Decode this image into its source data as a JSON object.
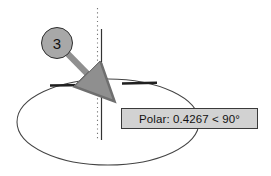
{
  "drawing": {
    "title": "Ellipse polar tracking step",
    "background_color": "#ffffff",
    "line_color": "#3a3a3a"
  },
  "callout": {
    "number": "3",
    "fill_color": "#a8a8a8",
    "border_color": "#2e2e2e",
    "arrow_color": "#8f8f8f"
  },
  "tooltip": {
    "text": "Polar: 0.4267 < 90°",
    "label": "Polar:",
    "distance": "0.4267",
    "comparator": "<",
    "angle": "90°",
    "background_color": "#d2d2d2",
    "border_color": "#3a3a3a",
    "text_color": "#111111"
  },
  "markers": {
    "snap_marker": "x-snap-cross",
    "tracking_line_style": "dotted",
    "tracking_line_angle": "90"
  },
  "geometry": {
    "ellipse_label": "ellipse-outline",
    "axis_tick_left": "major-axis-tick-left",
    "axis_tick_right": "major-axis-tick-right",
    "vertical_axis": "minor-axis-line"
  }
}
